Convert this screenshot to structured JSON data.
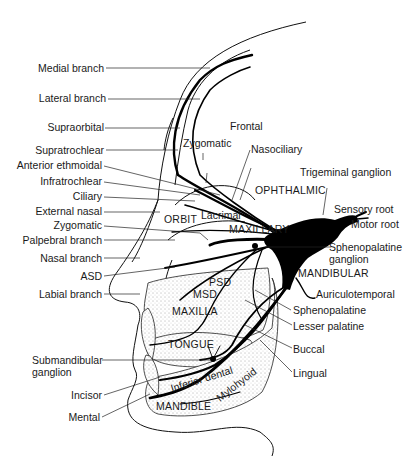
{
  "diagram": {
    "type": "anatomical illustration",
    "colors": {
      "ink": "#000000",
      "background": "#ffffff"
    },
    "left_labels": [
      "Medial branch",
      "Lateral branch",
      "Supraorbital",
      "Supratrochlear",
      "Anterior ethmoidal",
      "Infratrochlear",
      "Ciliary",
      "External nasal",
      "Zygomatic",
      "Palpebral branch",
      "Nasal branch",
      "ASD",
      "Labial branch",
      "Submandibular",
      "ganglion",
      "Incisor",
      "Mental"
    ],
    "right_labels": [
      "Trigeminal ganglion",
      "Sensory root",
      "Motor root",
      "Sphenopalatine",
      "ganglion",
      "MANDIBULAR",
      "Auriculotemporal",
      "Sphenopalatine",
      "Lesser palatine",
      "Buccal",
      "Lingual"
    ],
    "top_labels": [
      "Frontal",
      "Zygomatic",
      "Nasociliary",
      "OPHTHALMIC"
    ],
    "internal_labels": [
      "ORBIT",
      "Lacrimal",
      "MAXILLARY",
      "PSD",
      "MSD",
      "MAXILLA",
      "TONGUE",
      "Inferior dental",
      "Mylohyoid",
      "MANDIBLE"
    ]
  }
}
